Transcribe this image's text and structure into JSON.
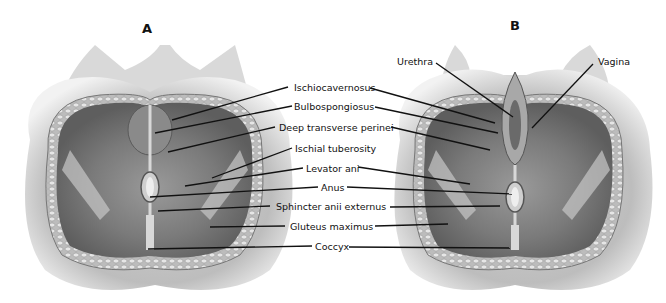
{
  "figure": {
    "panels": [
      {
        "id": "A",
        "letter": "A"
      },
      {
        "id": "B",
        "letter": "B"
      }
    ],
    "center_labels": [
      "Ischiocavernosus",
      "Bulbospongiosus",
      "Deep transverse perinei",
      "Ischial tuberosity",
      "Levator ani",
      "Anus",
      "Sphincter anii externus",
      "Gluteus maximus",
      "Coccyx"
    ],
    "panel_b_labels": {
      "urethra": "Urethra",
      "vagina": "Vagina"
    },
    "colors": {
      "background": "#ffffff",
      "skin_light": "#d9d9d9",
      "skin_mid": "#a8a8a8",
      "muscle_dark": "#6e6e6e",
      "fat_border": "#c8c8c8",
      "leader_line": "#111111"
    }
  }
}
